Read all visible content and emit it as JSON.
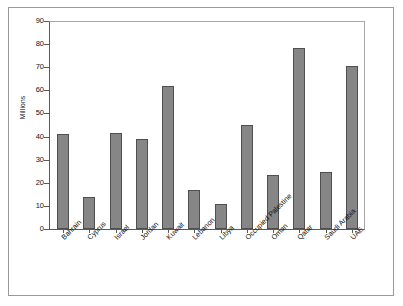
{
  "chart_data": {
    "type": "bar",
    "title": "",
    "xlabel": "",
    "ylabel": "Millions",
    "ylim": [
      0,
      90
    ],
    "ytick_step": 10,
    "yticks": [
      "0",
      "10",
      "20",
      "30",
      "40",
      "50",
      "60",
      "70",
      "80",
      "90"
    ],
    "grid": false,
    "legend": null,
    "bar_color": "#868686",
    "bar_edge_color": "#4f4f4f",
    "frame_color": "#9a9a9a",
    "categories": [
      "Bahrain",
      "Cyprus",
      "Israel",
      "Jordan",
      "Kuwait",
      "Lebanon",
      "Libya",
      "Occupied Palestine",
      "Oman",
      "Qatar",
      "Saudi Arabia",
      "UAE"
    ],
    "values": [
      41,
      14,
      41.5,
      39,
      62,
      17,
      11,
      45,
      23.5,
      78.5,
      24.5,
      70.5
    ]
  }
}
